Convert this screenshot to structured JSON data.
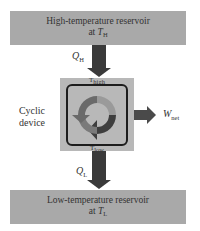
{
  "high_reservoir": {
    "line1": "High-temperature reservoir",
    "line2_prefix": "at ",
    "symbol": "T",
    "subscript": "H"
  },
  "low_reservoir": {
    "line1": "Low-temperature reservoir",
    "line2_prefix": "at ",
    "symbol": "T",
    "subscript": "L"
  },
  "heat_in": {
    "symbol": "Q",
    "subscript": "H"
  },
  "heat_out": {
    "symbol": "Q",
    "subscript": "L"
  },
  "device": {
    "label_line1": "Cyclic",
    "label_line2": "device",
    "top_temp": "T",
    "top_temp_sub": "high",
    "bottom_temp": "T",
    "bottom_temp_sub": "low"
  },
  "work": {
    "symbol": "W",
    "subscript": "net"
  },
  "colors": {
    "reservoir": "#a9a9a9",
    "device": "#b8b8b8",
    "arrow": "#3a3a3a"
  }
}
